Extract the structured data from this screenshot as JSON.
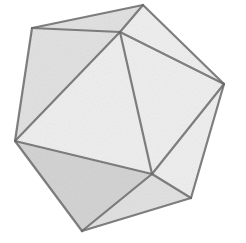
{
  "figure": {
    "style": "grayscale wireframe with shaded translucent faces",
    "colors": {
      "background": "#ffffff",
      "edge": "#6a6a6a",
      "edge_light": "#8c8c8c",
      "face_light": "#efefef",
      "face_mid": "#e2e2e2",
      "face_dark": "#d4d4d4"
    },
    "vertices": {
      "A": [
        143,
        5
      ],
      "B": [
        32,
        28
      ],
      "C": [
        120,
        32
      ],
      "D": [
        224,
        84
      ],
      "E": [
        15,
        141
      ],
      "F": [
        152,
        174
      ],
      "G": [
        191,
        198
      ],
      "H": [
        82,
        231
      ]
    },
    "faces": [
      {
        "name": "top-left",
        "points": "A B C",
        "shade": "face_mid"
      },
      {
        "name": "top-right",
        "points": "A C D",
        "shade": "face_light"
      },
      {
        "name": "left",
        "points": "B E C",
        "shade": "face_mid"
      },
      {
        "name": "front-center",
        "points": "C E F",
        "shade": "face_light"
      },
      {
        "name": "front-right",
        "points": "C F D",
        "shade": "face_light"
      },
      {
        "name": "right-lower",
        "points": "D F G",
        "shade": "face_light"
      },
      {
        "name": "bottom-left",
        "points": "E H F",
        "shade": "face_dark"
      },
      {
        "name": "bottom-right",
        "points": "F H G",
        "shade": "face_mid"
      }
    ],
    "edges": [
      [
        "A",
        "B"
      ],
      [
        "A",
        "C"
      ],
      [
        "B",
        "C"
      ],
      [
        "A",
        "D"
      ],
      [
        "C",
        "D"
      ],
      [
        "B",
        "E"
      ],
      [
        "C",
        "E"
      ],
      [
        "C",
        "F"
      ],
      [
        "D",
        "F"
      ],
      [
        "D",
        "G"
      ],
      [
        "E",
        "F"
      ],
      [
        "E",
        "H"
      ],
      [
        "F",
        "G"
      ],
      [
        "F",
        "H"
      ],
      [
        "G",
        "H"
      ]
    ]
  }
}
